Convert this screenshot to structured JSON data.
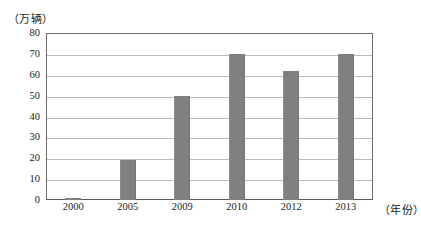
{
  "chart_data": {
    "type": "bar",
    "title": "",
    "subtitle": "",
    "xlabel": "（年份）",
    "ylabel": "（万辆）",
    "categories": [
      "2000",
      "2005",
      "2009",
      "2010",
      "2012",
      "2013"
    ],
    "values": [
      1,
      19,
      50,
      70,
      62,
      70
    ],
    "series": [
      {
        "name": "",
        "values": [
          1,
          19,
          50,
          70,
          62,
          70
        ]
      }
    ],
    "ylim": [
      0,
      80
    ],
    "y_ticks": [
      0,
      10,
      20,
      30,
      40,
      50,
      60,
      70,
      80
    ],
    "y_tick_labels": [
      "0",
      "10",
      "20",
      "30",
      "40",
      "50",
      "60",
      "70",
      "80"
    ],
    "x_tick_labels": [
      "2000",
      "2005",
      "2009",
      "2010",
      "2012",
      "2013"
    ],
    "grid": true,
    "grid_axis": "y",
    "legend": false,
    "legend_position": "none",
    "bar_color": "#808080",
    "frame_color": "#6e6e6e",
    "gridline_color": "#b9b9b9",
    "background_color": "#ffffff",
    "text_color": "#1c1c1c",
    "annotations": []
  },
  "axes": {
    "y_unit_label": "（万辆）",
    "x_unit_label": "（年份）"
  }
}
